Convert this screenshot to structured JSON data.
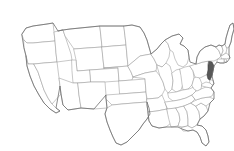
{
  "figure": {
    "type": "choropleth-locator-map",
    "region": "Contiguous United States",
    "projection": "albers-usa-like",
    "width_px": 234,
    "height_px": 151,
    "background_color": "#ffffff",
    "border_color": "#9a9a9a",
    "outline_color": "#6d6d6d",
    "highlight_fill_color": "#585858",
    "default_fill_color": "#ffffff",
    "caption": "",
    "legend": "",
    "labels_visible": false
  },
  "highlight": {
    "state_name": "New Jersey",
    "state_code": "NJ",
    "status": "selected",
    "fill": "#585858"
  },
  "map_data": {
    "type": "locator-map",
    "highlighted_states": [
      "NJ"
    ],
    "states": [
      {
        "code": "WA",
        "name": "Washington",
        "highlighted": false
      },
      {
        "code": "OR",
        "name": "Oregon",
        "highlighted": false
      },
      {
        "code": "CA",
        "name": "California",
        "highlighted": false
      },
      {
        "code": "ID",
        "name": "Idaho",
        "highlighted": false
      },
      {
        "code": "NV",
        "name": "Nevada",
        "highlighted": false
      },
      {
        "code": "MT",
        "name": "Montana",
        "highlighted": false
      },
      {
        "code": "WY",
        "name": "Wyoming",
        "highlighted": false
      },
      {
        "code": "UT",
        "name": "Utah",
        "highlighted": false
      },
      {
        "code": "AZ",
        "name": "Arizona",
        "highlighted": false
      },
      {
        "code": "CO",
        "name": "Colorado",
        "highlighted": false
      },
      {
        "code": "NM",
        "name": "New Mexico",
        "highlighted": false
      },
      {
        "code": "ND",
        "name": "North Dakota",
        "highlighted": false
      },
      {
        "code": "SD",
        "name": "South Dakota",
        "highlighted": false
      },
      {
        "code": "NE",
        "name": "Nebraska",
        "highlighted": false
      },
      {
        "code": "KS",
        "name": "Kansas",
        "highlighted": false
      },
      {
        "code": "OK",
        "name": "Oklahoma",
        "highlighted": false
      },
      {
        "code": "TX",
        "name": "Texas",
        "highlighted": false
      },
      {
        "code": "MN",
        "name": "Minnesota",
        "highlighted": false
      },
      {
        "code": "IA",
        "name": "Iowa",
        "highlighted": false
      },
      {
        "code": "MO",
        "name": "Missouri",
        "highlighted": false
      },
      {
        "code": "AR",
        "name": "Arkansas",
        "highlighted": false
      },
      {
        "code": "LA",
        "name": "Louisiana",
        "highlighted": false
      },
      {
        "code": "WI",
        "name": "Wisconsin",
        "highlighted": false
      },
      {
        "code": "IL",
        "name": "Illinois",
        "highlighted": false
      },
      {
        "code": "MI",
        "name": "Michigan",
        "highlighted": false
      },
      {
        "code": "IN",
        "name": "Indiana",
        "highlighted": false
      },
      {
        "code": "OH",
        "name": "Ohio",
        "highlighted": false
      },
      {
        "code": "KY",
        "name": "Kentucky",
        "highlighted": false
      },
      {
        "code": "TN",
        "name": "Tennessee",
        "highlighted": false
      },
      {
        "code": "MS",
        "name": "Mississippi",
        "highlighted": false
      },
      {
        "code": "AL",
        "name": "Alabama",
        "highlighted": false
      },
      {
        "code": "GA",
        "name": "Georgia",
        "highlighted": false
      },
      {
        "code": "FL",
        "name": "Florida",
        "highlighted": false
      },
      {
        "code": "SC",
        "name": "South Carolina",
        "highlighted": false
      },
      {
        "code": "NC",
        "name": "North Carolina",
        "highlighted": false
      },
      {
        "code": "VA",
        "name": "Virginia",
        "highlighted": false
      },
      {
        "code": "WV",
        "name": "West Virginia",
        "highlighted": false
      },
      {
        "code": "MD",
        "name": "Maryland",
        "highlighted": false
      },
      {
        "code": "DE",
        "name": "Delaware",
        "highlighted": false
      },
      {
        "code": "PA",
        "name": "Pennsylvania",
        "highlighted": false
      },
      {
        "code": "NJ",
        "name": "New Jersey",
        "highlighted": true
      },
      {
        "code": "NY",
        "name": "New York",
        "highlighted": false
      },
      {
        "code": "CT",
        "name": "Connecticut",
        "highlighted": false
      },
      {
        "code": "RI",
        "name": "Rhode Island",
        "highlighted": false
      },
      {
        "code": "MA",
        "name": "Massachusetts",
        "highlighted": false
      },
      {
        "code": "VT",
        "name": "Vermont",
        "highlighted": false
      },
      {
        "code": "NH",
        "name": "New Hampshire",
        "highlighted": false
      },
      {
        "code": "ME",
        "name": "Maine",
        "highlighted": false
      }
    ]
  }
}
